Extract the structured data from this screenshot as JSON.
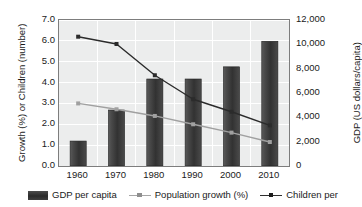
{
  "chart_data": {
    "type": "bar",
    "title": "",
    "subtitle": "",
    "categories": [
      "1960",
      "1970",
      "1980",
      "1990",
      "2000",
      "2010"
    ],
    "x": [
      1960,
      1970,
      1980,
      1990,
      2000,
      2010
    ],
    "xlabel": "",
    "grid": true,
    "legend_position": "bottom",
    "axes": {
      "left": {
        "label": "Growth (%) or Children (number)",
        "ylim": [
          0.0,
          7.0
        ],
        "ticks": [
          0.0,
          1.0,
          2.0,
          3.0,
          4.0,
          5.0,
          6.0,
          7.0
        ],
        "tick_labels": [
          "0.0",
          "1.0",
          "2.0",
          "3.0",
          "4.0",
          "5.0",
          "6.0",
          "7.0"
        ]
      },
      "right": {
        "label": "GDP (US dollars/capita)",
        "ylim": [
          0,
          12000
        ],
        "ticks": [
          0,
          2000,
          4000,
          6000,
          8000,
          10000,
          12000
        ],
        "tick_labels": [
          "0",
          "2,000",
          "4,000",
          "6,000",
          "8,000",
          "10,000",
          "12,000"
        ]
      }
    },
    "series": [
      {
        "name": "GDP per capita",
        "legend_label": "GDP per capita",
        "type": "bar",
        "axis": "right",
        "unit": "US dollars/capita",
        "color": "#3a3a3a",
        "values": [
          2050,
          4600,
          7150,
          7150,
          8150,
          10250
        ]
      },
      {
        "name": "Population growth (%)",
        "legend_label": "Population growth (%)",
        "type": "line",
        "axis": "left",
        "unit": "%",
        "color": "#a0a0a0",
        "values": [
          3.0,
          2.72,
          2.4,
          2.0,
          1.6,
          1.15
        ]
      },
      {
        "name": "Children per",
        "legend_label": "Children per",
        "legend_truncated": true,
        "type": "line",
        "axis": "left",
        "unit": "number",
        "color": "#2b2b2b",
        "values": [
          6.2,
          5.85,
          4.35,
          3.2,
          2.6,
          1.95
        ]
      }
    ]
  }
}
